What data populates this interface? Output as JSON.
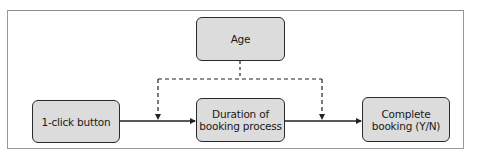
{
  "diagram": {
    "type": "causal-diagram",
    "nodes": [
      {
        "id": "age",
        "label": "Age"
      },
      {
        "id": "one_click",
        "label": "1-click button"
      },
      {
        "id": "duration",
        "label": "Duration of\nbooking process"
      },
      {
        "id": "complete",
        "label": "Complete\nbooking (Y/N)"
      }
    ],
    "edges": [
      {
        "from": "one_click",
        "to": "duration",
        "style": "solid"
      },
      {
        "from": "duration",
        "to": "complete",
        "style": "solid"
      },
      {
        "from": "age",
        "to": "one_click->duration",
        "style": "dashed"
      },
      {
        "from": "age",
        "to": "duration->complete",
        "style": "dashed"
      }
    ],
    "colors": {
      "node_fill": "#dcdcdc",
      "node_border": "#2a2a2a",
      "line": "#222222",
      "frame": "#9a9a9a"
    }
  }
}
